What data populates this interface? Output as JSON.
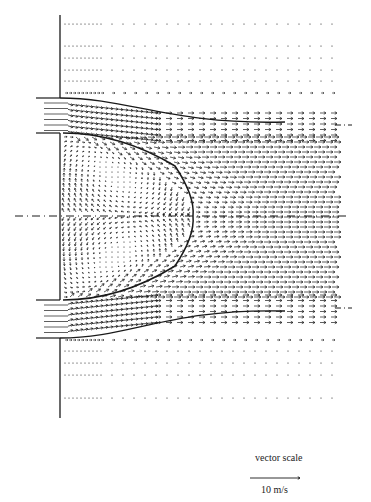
{
  "figure": {
    "type": "velocity vector field",
    "colors": {
      "ink": "#1a1a1a",
      "background": "#ffffff"
    }
  },
  "geometry": {
    "wall_x": 60,
    "wall_top": 15,
    "wall_bottom": 418,
    "field_right": 335,
    "centerline_y": 216,
    "upper_jet": {
      "top": 98,
      "bottom": 133,
      "inlet_start_x": 36
    },
    "lower_jet": {
      "top": 300,
      "bottom": 338,
      "inlet_start_x": 36
    },
    "boundary_apex_x": 193
  },
  "legend": {
    "title": "vector scale",
    "value_label": "10 m/s",
    "arrow_length_px": 50
  }
}
